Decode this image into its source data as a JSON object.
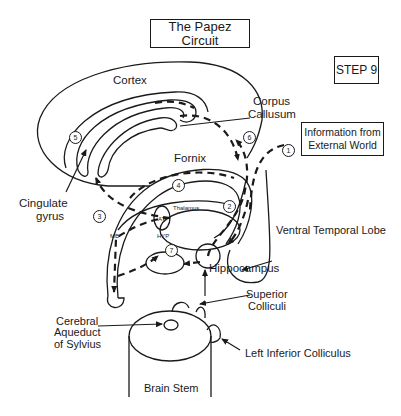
{
  "title": "The Papez Circuit",
  "step": "STEP 9",
  "info_box": {
    "line1": "Information from",
    "line2": "External World"
  },
  "labels": {
    "cortex": "Cortex",
    "corpus_callosum_1": "Corpus",
    "corpus_callosum_2": "Callusum",
    "fornix": "Fornix",
    "cingulate_1": "Cingulate",
    "cingulate_2": "gyrus",
    "thalamus": "Thalamus",
    "at": "AT",
    "mb": "MB",
    "hyp": "HYP",
    "ventral_temporal_lobe": "Ventral Temporal Lobe",
    "hippocampus": "Hippocampus",
    "superior_colliculi_1": "Superior",
    "superior_colliculi_2": "Colliculi",
    "cerebral_aqueduct_1": "Cerebral",
    "cerebral_aqueduct_2": "Aqueduct",
    "cerebral_aqueduct_3": "of Sylvius",
    "left_inferior_colliculus": "Left  Inferior Colliculus",
    "brain_stem": "Brain Stem"
  },
  "circuit_steps": [
    "1",
    "2",
    "3",
    "4",
    "5",
    "6",
    "7"
  ],
  "colors": {
    "ink": "#1a1a1a",
    "background": "#ffffff"
  }
}
